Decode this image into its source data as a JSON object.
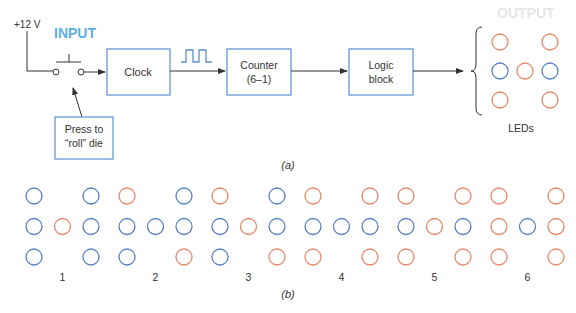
{
  "colors": {
    "box_stroke": "#5b8fd0",
    "led_on": "#e8876a",
    "led_off": "#5a80c0",
    "input_label": "#5bb0e6",
    "output_label": "#e6e6e6",
    "line": "#333333"
  },
  "part_a": {
    "caption": "(a)",
    "supply_label": "+12 V",
    "input_label": "INPUT",
    "output_label": "OUTPUT",
    "press_note_line1": "Press to",
    "press_note_line2": "“roll” die",
    "clock_label": "Clock",
    "counter_line1": "Counter",
    "counter_line2": "(6–1)",
    "logic_line1": "Logic",
    "logic_line2": "block",
    "leds_label": "LEDs",
    "output_leds": {
      "top": [
        "on",
        "on"
      ],
      "middle": [
        "off",
        "on",
        "off"
      ],
      "bottom": [
        "on",
        "on"
      ]
    }
  },
  "part_b": {
    "caption": "(b)",
    "faces": [
      {
        "label": "1",
        "top": [
          "off",
          "off"
        ],
        "middle": [
          "off",
          "on",
          "off"
        ],
        "bottom": [
          "off",
          "off"
        ]
      },
      {
        "label": "2",
        "top": [
          "on",
          "off"
        ],
        "middle": [
          "off",
          "off",
          "off"
        ],
        "bottom": [
          "off",
          "on"
        ]
      },
      {
        "label": "3",
        "top": [
          "on",
          "off"
        ],
        "middle": [
          "off",
          "on",
          "off"
        ],
        "bottom": [
          "off",
          "on"
        ]
      },
      {
        "label": "4",
        "top": [
          "on",
          "on"
        ],
        "middle": [
          "off",
          "off",
          "off"
        ],
        "bottom": [
          "on",
          "on"
        ]
      },
      {
        "label": "5",
        "top": [
          "on",
          "on"
        ],
        "middle": [
          "off",
          "on",
          "off"
        ],
        "bottom": [
          "on",
          "on"
        ]
      },
      {
        "label": "6",
        "top": [
          "on",
          "on"
        ],
        "middle": [
          "on",
          "off",
          "on"
        ],
        "bottom": [
          "on",
          "on"
        ]
      }
    ]
  }
}
